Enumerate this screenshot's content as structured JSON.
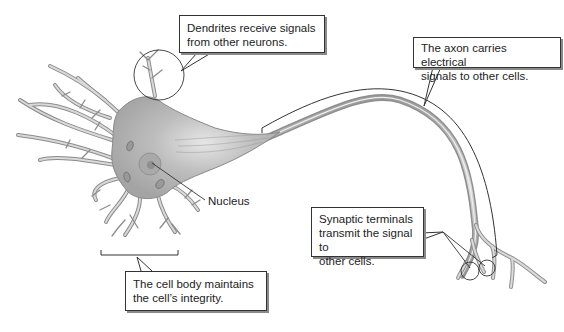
{
  "diagram": {
    "callouts": {
      "dendrites": {
        "line1": "Dendrites receive signals",
        "line2": "from other neurons."
      },
      "axon": {
        "line1": "The axon carries electrical",
        "line2": "signals to other cells."
      },
      "cell_body": {
        "line1": "The cell body maintains",
        "line2": "the cell’s integrity."
      },
      "synaptic": {
        "line1": "Synaptic terminals",
        "line2": "transmit the signal to",
        "line3": "other cells."
      }
    },
    "labels": {
      "nucleus": "Nucleus"
    },
    "colors": {
      "neuron_fill": "#b8b8b8",
      "neuron_edge": "#7a7a7a",
      "outline": "#333333",
      "shadow": "#8a8a8a"
    }
  }
}
